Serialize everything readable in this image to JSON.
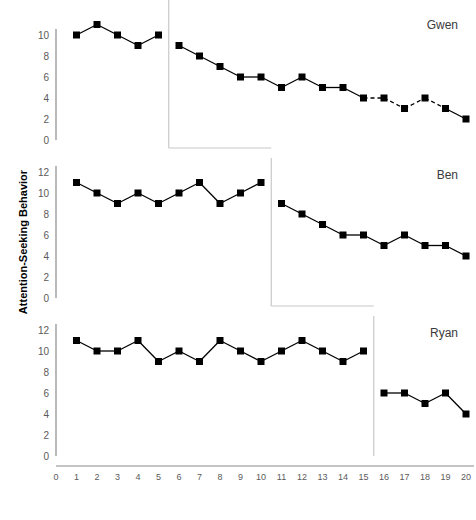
{
  "chart_data": {
    "type": "line",
    "title": "",
    "xlabel": "",
    "ylabel": "Attention-Seeking Behavior",
    "xlim": [
      0,
      20
    ],
    "ylim": [
      0,
      12
    ],
    "xticks": [
      0,
      1,
      2,
      3,
      4,
      5,
      6,
      7,
      8,
      9,
      10,
      11,
      12,
      13,
      14,
      15,
      16,
      17,
      18,
      19,
      20
    ],
    "yticks": [
      0,
      2,
      4,
      6,
      8,
      10,
      12
    ],
    "grid": false,
    "legend": "none",
    "design": "multiple-baseline across participants",
    "panels": [
      {
        "name": "Gwen",
        "phase_change_x": 5.5,
        "yticks_visible": [
          0,
          2,
          4,
          6,
          8,
          10
        ],
        "series": [
          {
            "name": "Baseline",
            "x": [
              1,
              2,
              3,
              4,
              5
            ],
            "values": [
              10,
              11,
              10,
              9,
              10
            ],
            "linestyle": "solid"
          },
          {
            "name": "Intervention",
            "x": [
              6,
              7,
              8,
              9,
              10,
              11,
              12,
              13,
              14,
              15,
              16,
              17,
              18,
              19,
              20
            ],
            "values": [
              9,
              8,
              7,
              6,
              6,
              5,
              6,
              5,
              5,
              4,
              4,
              3,
              4,
              3,
              2
            ],
            "linestyle": "mixed",
            "dashed_segments": [
              [
                15,
                16
              ],
              [
                16,
                17
              ],
              [
                17,
                18
              ],
              [
                18,
                19
              ]
            ]
          }
        ]
      },
      {
        "name": "Ben",
        "phase_change_x": 10.5,
        "yticks_visible": [
          0,
          2,
          4,
          6,
          8,
          10,
          12
        ],
        "series": [
          {
            "name": "Baseline",
            "x": [
              1,
              2,
              3,
              4,
              5,
              6,
              7,
              8,
              9,
              10
            ],
            "values": [
              11,
              10,
              9,
              10,
              9,
              10,
              11,
              9,
              10,
              11
            ],
            "linestyle": "solid"
          },
          {
            "name": "Intervention",
            "x": [
              11,
              12,
              13,
              14,
              15,
              16,
              17,
              18,
              19,
              20
            ],
            "values": [
              9,
              8,
              7,
              6,
              6,
              5,
              6,
              5,
              5,
              4
            ],
            "linestyle": "solid"
          }
        ]
      },
      {
        "name": "Ryan",
        "phase_change_x": 15.5,
        "yticks_visible": [
          0,
          2,
          4,
          6,
          8,
          10,
          12
        ],
        "series": [
          {
            "name": "Baseline",
            "x": [
              1,
              2,
              3,
              4,
              5,
              6,
              7,
              8,
              9,
              10,
              11,
              12,
              13,
              14,
              15
            ],
            "values": [
              11,
              10,
              10,
              11,
              9,
              10,
              9,
              11,
              10,
              9,
              10,
              11,
              10,
              9,
              10
            ],
            "linestyle": "solid"
          },
          {
            "name": "Intervention",
            "x": [
              16,
              17,
              18,
              19,
              20
            ],
            "values": [
              6,
              6,
              5,
              6,
              4
            ],
            "linestyle": "solid"
          }
        ]
      }
    ],
    "marker": {
      "shape": "square",
      "color": "#000000",
      "size": 7
    },
    "line_color": "#000000"
  }
}
